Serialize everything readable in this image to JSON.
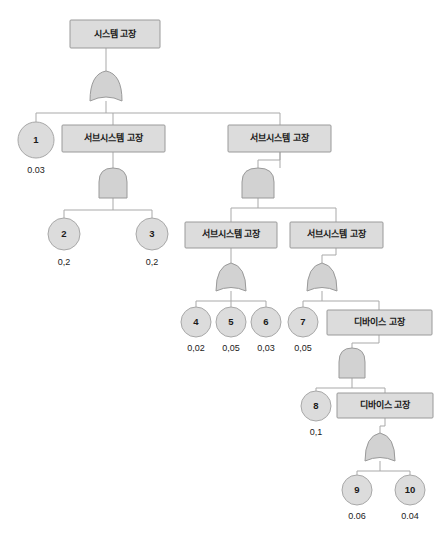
{
  "diagram": {
    "colors": {
      "box_fill": "#dcdcdc",
      "box_stroke": "#9a9a9a",
      "gate_fill": "#d2d2d2",
      "circle_fill": "#dcdcdc",
      "line": "#a9a9a9",
      "text": "#1a1a1a",
      "background": "#ffffff"
    },
    "labels": {
      "system_failure": "시스템 고장",
      "subsystem_failure": "서브시스템 고장",
      "device_failure": "디바이스 고장"
    },
    "event_boxes": [
      {
        "id": "top",
        "label": "시스템 고장",
        "x": 70,
        "y": 20,
        "w": 90,
        "h": 28
      },
      {
        "id": "sub-a",
        "label": "서브시스템 고장",
        "x": 62,
        "y": 125,
        "w": 103,
        "h": 27
      },
      {
        "id": "sub-b",
        "label": "서브시스템 고장",
        "x": 228,
        "y": 125,
        "w": 103,
        "h": 27
      },
      {
        "id": "sub-c",
        "label": "서브시스템 고장",
        "x": 185,
        "y": 222,
        "w": 92,
        "h": 26
      },
      {
        "id": "sub-d",
        "label": "서브시스템 고장",
        "x": 290,
        "y": 222,
        "w": 93,
        "h": 26
      },
      {
        "id": "dev-a",
        "label": "디바이스 고장",
        "x": 327,
        "y": 310,
        "w": 105,
        "h": 25
      },
      {
        "id": "dev-b",
        "label": "디바이스 고장",
        "x": 337,
        "y": 393,
        "w": 96,
        "h": 25
      }
    ],
    "gates": [
      {
        "id": "gate-top",
        "type": "or",
        "cx": 106,
        "cy": 88
      },
      {
        "id": "gate-sub-a",
        "type": "and",
        "cx": 113,
        "cy": 183
      },
      {
        "id": "gate-sub-b",
        "type": "and",
        "cx": 258,
        "cy": 183
      },
      {
        "id": "gate-sub-c",
        "type": "or",
        "cx": 231,
        "cy": 278
      },
      {
        "id": "gate-sub-d",
        "type": "or",
        "cx": 322,
        "cy": 278
      },
      {
        "id": "gate-dev-a",
        "type": "and",
        "cx": 352,
        "cy": 363
      },
      {
        "id": "gate-dev-b",
        "type": "or",
        "cx": 380,
        "cy": 448
      }
    ],
    "basic_events": [
      {
        "id": "e1",
        "number": "1",
        "probability": "0.03",
        "cx": 36,
        "cy": 140,
        "r": 18
      },
      {
        "id": "e2",
        "number": "2",
        "probability": "0,2",
        "cx": 64,
        "cy": 234,
        "r": 16
      },
      {
        "id": "e3",
        "number": "3",
        "probability": "0,2",
        "cx": 152,
        "cy": 234,
        "r": 16
      },
      {
        "id": "e4",
        "number": "4",
        "probability": "0,02",
        "cx": 196,
        "cy": 322,
        "r": 15
      },
      {
        "id": "e5",
        "number": "5",
        "probability": "0,05",
        "cx": 231,
        "cy": 322,
        "r": 15
      },
      {
        "id": "e6",
        "number": "6",
        "probability": "0,03",
        "cx": 266,
        "cy": 322,
        "r": 15
      },
      {
        "id": "e7",
        "number": "7",
        "probability": "0,05",
        "cx": 303,
        "cy": 322,
        "r": 15
      },
      {
        "id": "e8",
        "number": "8",
        "probability": "0,1",
        "cx": 316,
        "cy": 406,
        "r": 15
      },
      {
        "id": "e9",
        "number": "9",
        "probability": "0.06",
        "cx": 357,
        "cy": 490,
        "r": 15
      },
      {
        "id": "e10",
        "number": "10",
        "probability": "0.04",
        "cx": 410,
        "cy": 490,
        "r": 15
      }
    ],
    "tree_structure": {
      "root": "시스템 고장",
      "root_gate": "or",
      "root_children": [
        "1 (0.03)",
        "서브시스템 고장 (left)",
        "서브시스템 고장 (right)"
      ],
      "left_subsystem_gate": "and",
      "left_subsystem_children": [
        "2 (0,2)",
        "3 (0,2)"
      ],
      "right_subsystem_gate": "and",
      "right_subsystem_children": [
        "서브시스템 고장 (C)",
        "서브시스템 고장 (D)"
      ],
      "subsystem_c_gate": "or",
      "subsystem_c_children": [
        "4 (0,02)",
        "5 (0,05)",
        "6 (0,03)"
      ],
      "subsystem_d_gate": "or",
      "subsystem_d_children": [
        "7 (0,05)",
        "디바이스 고장 (A)"
      ],
      "device_a_gate": "and",
      "device_a_children": [
        "8 (0,1)",
        "디바이스 고장 (B)"
      ],
      "device_b_gate": "or",
      "device_b_children": [
        "9 (0.06)",
        "10 (0.04)"
      ]
    }
  }
}
